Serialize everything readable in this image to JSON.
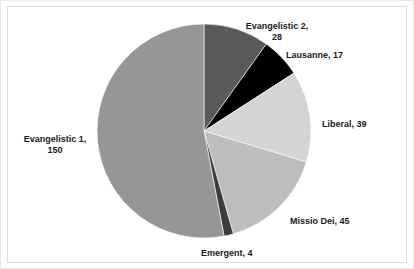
{
  "chart_data": {
    "type": "pie",
    "title": "",
    "subtitle": "",
    "xlabel": "",
    "ylabel": "",
    "grid": false,
    "legend_position": "none",
    "label_format": "name, value",
    "total": 283,
    "start_angle_deg": 0,
    "direction": "clockwise",
    "categories": [
      "Evangelistic 2",
      "Lausanne",
      "Liberal",
      "Missio Dei",
      "Emergent",
      "Evangelistic 1"
    ],
    "values": [
      28,
      17,
      39,
      45,
      4,
      150
    ],
    "colors": [
      "#5a5a5a",
      "#000000",
      "#d4d4d4",
      "#bdbdbd",
      "#3c3c3c",
      "#969696"
    ],
    "slices": [
      {
        "name": "Evangelistic 2",
        "value": 28,
        "color": "#5a5a5a",
        "label": "Evangelistic 2,\n28"
      },
      {
        "name": "Lausanne",
        "value": 17,
        "color": "#000000",
        "label": "Lausanne, 17"
      },
      {
        "name": "Liberal",
        "value": 39,
        "color": "#d4d4d4",
        "label": "Liberal, 39"
      },
      {
        "name": "Missio Dei",
        "value": 45,
        "color": "#bdbdbd",
        "label": "Missio Dei, 45"
      },
      {
        "name": "Emergent",
        "value": 4,
        "color": "#3c3c3c",
        "label": "Emergent, 4"
      },
      {
        "name": "Evangelistic 1",
        "value": 150,
        "color": "#969696",
        "label": "Evangelistic 1,\n150"
      }
    ]
  },
  "labels": {
    "evangelistic2": "Evangelistic 2,\n28",
    "lausanne": "Lausanne, 17",
    "liberal": "Liberal, 39",
    "missio_dei": "Missio Dei, 45",
    "emergent": "Emergent, 4",
    "evangelistic1": "Evangelistic 1,\n150"
  },
  "geometry": {
    "center_x": 203,
    "center_y": 130,
    "radius": 107
  },
  "style": {
    "background": "#ffffff",
    "frame_border": "#dcdcdc",
    "label_color": "#1a1a1a"
  }
}
